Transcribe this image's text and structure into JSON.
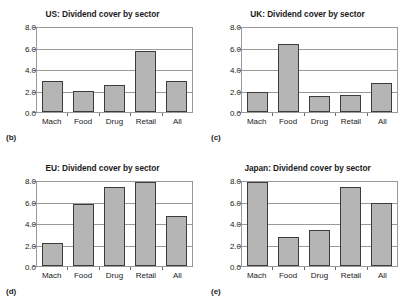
{
  "figure": {
    "sectors": [
      "Mach",
      "Food",
      "Drug",
      "Retail",
      "All"
    ],
    "yticks": [
      "0.0",
      "2.0",
      "4.0",
      "6.0",
      "8.0"
    ],
    "bar_color": "#b5b5b5",
    "bar_edge_color": "#3c3c3c",
    "grid_color": "#9a9a9a"
  },
  "panels": [
    {
      "letter": "(b)",
      "title": "US: Dividend cover by sector",
      "chart_data": {
        "type": "bar",
        "title": "US: Dividend cover by sector",
        "categories": [
          "Mach",
          "Food",
          "Drug",
          "Retail",
          "All"
        ],
        "values": [
          3.0,
          2.0,
          2.55,
          5.8,
          3.0
        ],
        "xlabel": "",
        "ylabel": "",
        "ylim": [
          0.0,
          8.0
        ],
        "yticks": [
          0.0,
          2.0,
          4.0,
          6.0,
          8.0
        ],
        "grid": true,
        "legend": false
      }
    },
    {
      "letter": "(c)",
      "title": "UK: Dividend cover by sector",
      "chart_data": {
        "type": "bar",
        "title": "UK: Dividend cover by sector",
        "categories": [
          "Mach",
          "Food",
          "Drug",
          "Retail",
          "All"
        ],
        "values": [
          1.95,
          6.45,
          1.55,
          1.65,
          2.75
        ],
        "xlabel": "",
        "ylabel": "",
        "ylim": [
          0.0,
          8.0
        ],
        "yticks": [
          0.0,
          2.0,
          4.0,
          6.0,
          8.0
        ],
        "grid": true,
        "legend": false
      }
    },
    {
      "letter": "(d)",
      "title": "EU: Dividend cover by sector",
      "chart_data": {
        "type": "bar",
        "title": "EU: Dividend cover by sector",
        "categories": [
          "Mach",
          "Food",
          "Drug",
          "Retail",
          "All"
        ],
        "values": [
          2.2,
          5.9,
          7.55,
          8.0,
          4.8
        ],
        "xlabel": "",
        "ylabel": "",
        "ylim": [
          0.0,
          8.0
        ],
        "yticks": [
          0.0,
          2.0,
          4.0,
          6.0,
          8.0
        ],
        "grid": true,
        "legend": false
      }
    },
    {
      "letter": "(e)",
      "title": "Japan: Dividend cover by sector",
      "chart_data": {
        "type": "bar",
        "title": "Japan: Dividend cover by sector",
        "categories": [
          "Mach",
          "Food",
          "Drug",
          "Retail",
          "All"
        ],
        "values": [
          8.0,
          2.75,
          3.45,
          7.55,
          6.0
        ],
        "xlabel": "",
        "ylabel": "",
        "ylim": [
          0.0,
          8.0
        ],
        "yticks": [
          0.0,
          2.0,
          4.0,
          6.0,
          8.0
        ],
        "grid": true,
        "legend": false
      }
    }
  ]
}
